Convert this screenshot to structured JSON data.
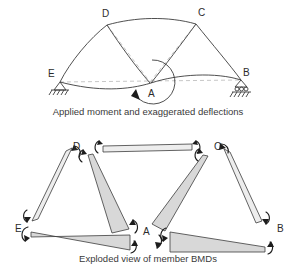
{
  "figure": {
    "top_panel": {
      "caption": "Applied moment and exaggerated deflections",
      "nodes": [
        {
          "id": "D",
          "label": "D",
          "x": 102,
          "y": 17
        },
        {
          "id": "C",
          "label": "C",
          "x": 198,
          "y": 16
        },
        {
          "id": "E",
          "label": "E",
          "x": 53,
          "y": 77
        },
        {
          "id": "B",
          "label": "B",
          "x": 243,
          "y": 76
        },
        {
          "id": "A",
          "label": "A",
          "x": 152,
          "y": 91
        }
      ],
      "supports": [
        {
          "at": "E",
          "type": "pin-hatched"
        },
        {
          "at": "B",
          "type": "roller-hatched"
        }
      ],
      "applied_moment": {
        "at": "A",
        "sense": "counterclockwise",
        "symbol": "circular-arc-arrow"
      }
    },
    "bottom_panel": {
      "caption": "Exploded view of member BMDs",
      "nodes": [
        {
          "id": "D",
          "label": "D",
          "x": 76,
          "y": 150
        },
        {
          "id": "C",
          "label": "C",
          "x": 216,
          "y": 150
        },
        {
          "id": "E",
          "label": "E",
          "x": 19,
          "y": 228
        },
        {
          "id": "B",
          "label": "B",
          "x": 277,
          "y": 228
        },
        {
          "id": "A",
          "label": "A",
          "x": 148,
          "y": 228
        }
      ],
      "members": [
        {
          "id": "DC",
          "from": "D",
          "to": "C",
          "shape": "thin-bar",
          "label": "member-dc"
        },
        {
          "id": "ED",
          "from": "E",
          "to": "D",
          "shape": "thin-sliver",
          "label": "member-ed"
        },
        {
          "id": "DA",
          "from": "D",
          "to": "A",
          "shape": "wedge",
          "label": "member-da"
        },
        {
          "id": "EA",
          "from": "E",
          "to": "A",
          "shape": "wedge",
          "label": "member-ea"
        },
        {
          "id": "CA",
          "from": "C",
          "to": "A",
          "shape": "wedge",
          "label": "member-ca"
        },
        {
          "id": "AB",
          "from": "A",
          "to": "B",
          "shape": "wedge",
          "label": "member-ab"
        },
        {
          "id": "CB",
          "from": "C",
          "to": "B",
          "shape": "thin-sliver",
          "label": "member-cb"
        }
      ]
    },
    "colors": {
      "bmd_fill": "#d8d8d8",
      "bmd_fill_light": "#ededed",
      "line": "#3c3c3c",
      "dashed": "#b9b9b9",
      "text": "#3a3a3a",
      "background": "#ffffff"
    }
  }
}
